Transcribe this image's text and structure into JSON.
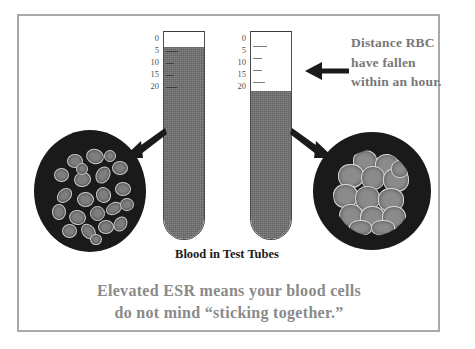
{
  "figure": {
    "title_caption": "Blood in Test Tubes",
    "bottom_caption_line1": "Elevated ESR means your blood cells",
    "bottom_caption_line2": "do not mind “sticking together.”",
    "callout_line1": "Distance RBC",
    "callout_line2": "have fallen",
    "callout_line3": "within an hour.",
    "colors": {
      "frame": "#a9a9a9",
      "blood": "#6e6e6e",
      "plasma": "#ffffff",
      "smear_background": "#1a1a1a",
      "cell": "#7e7e7e",
      "caption_gray": "#8a8a8a",
      "caption_black": "#1c1c1c",
      "arrow": "#1a1a1a"
    },
    "scale_ticks": [
      "0",
      "5",
      "10",
      "15",
      "20"
    ],
    "left_tube": {
      "label": "normal-esr-tube",
      "plasma_mark": "0",
      "blood_top_mark": "0"
    },
    "right_tube": {
      "label": "elevated-esr-tube",
      "plasma_mark": "0",
      "blood_top_mark": "20"
    },
    "left_smear": {
      "label": "dispersed-red-blood-cells"
    },
    "right_smear": {
      "label": "clumped-red-blood-cells"
    },
    "icons": {
      "arrow_left_callout": "arrow-left-icon",
      "arrow_to_left_smear": "arrow-down-left-icon",
      "arrow_to_right_smear": "arrow-down-right-icon"
    }
  }
}
